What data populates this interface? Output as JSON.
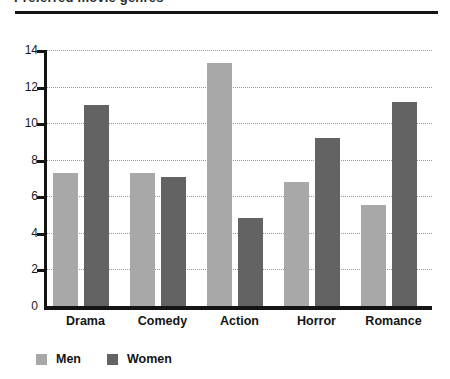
{
  "header": {
    "title_cutoff": "Preferred movie genres",
    "rule_color": "#141414"
  },
  "legend": {
    "position": "bottom-left",
    "items": [
      {
        "label": "Men",
        "color": "#a8a8a8",
        "swatch_name": "legend-swatch-men"
      },
      {
        "label": "Women",
        "color": "#636363",
        "swatch_name": "legend-swatch-women"
      }
    ]
  },
  "axis": {
    "y_ticks": [
      "0",
      "2",
      "4",
      "6",
      "8",
      "10",
      "12",
      "14"
    ]
  },
  "chart_data": {
    "type": "bar",
    "title": "",
    "xlabel": "",
    "ylabel": "",
    "ylim": [
      0,
      14
    ],
    "ytick_step": 2,
    "grid": true,
    "grid_style": "dotted-horizontal",
    "legend_position": "bottom-left",
    "categories": [
      "Drama",
      "Comedy",
      "Action",
      "Horror",
      "Romance"
    ],
    "series": [
      {
        "name": "Men",
        "color": "#a8a8a8",
        "values": [
          7.3,
          7.3,
          13.3,
          6.8,
          5.5
        ]
      },
      {
        "name": "Women",
        "color": "#636363",
        "values": [
          11.0,
          7.05,
          4.8,
          9.2,
          11.15
        ]
      }
    ]
  }
}
